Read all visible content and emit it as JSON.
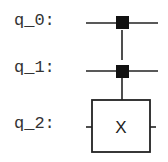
{
  "circuit": {
    "qubits": [
      {
        "label": "q_0:"
      },
      {
        "label": "q_1:"
      },
      {
        "label": "q_2:"
      }
    ],
    "gates": [
      {
        "type": "CCX",
        "controls": [
          "q_0",
          "q_1"
        ],
        "target": "q_2",
        "label": "X"
      }
    ],
    "colors": {
      "wire": "#222222",
      "control_dot": "#111111",
      "box_border": "#222222",
      "text": "#333333"
    }
  }
}
